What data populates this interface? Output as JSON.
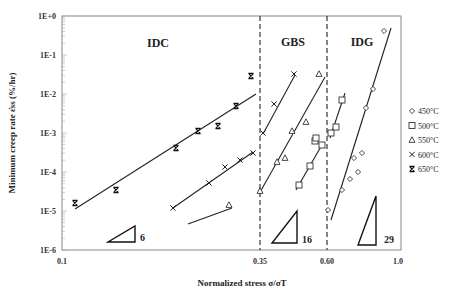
{
  "chart_data": {
    "type": "scatter",
    "title": "",
    "xlabel": "Normalized stress σ/σT",
    "ylabel": "Minimum creep rate ε̇ss (%/hr)",
    "xscale": "log",
    "yscale": "log",
    "xlim": [
      0.1,
      1.0
    ],
    "ylim": [
      1e-06,
      1.0
    ],
    "grid": false,
    "legend_position": "right",
    "x_ticks": [
      "0.1",
      "0.35",
      "0.60",
      "1.0"
    ],
    "y_ticks": [
      "1E+0",
      "1E-1",
      "1E-2",
      "1E-3",
      "1E-4",
      "1E-5",
      "1E-6"
    ],
    "regions": [
      {
        "label": "IDC",
        "x_range": [
          0.1,
          0.35
        ]
      },
      {
        "label": "GBS",
        "x_range": [
          0.35,
          0.6
        ]
      },
      {
        "label": "IDG",
        "x_range": [
          0.6,
          1.0
        ]
      }
    ],
    "boundaries": [
      0.35,
      0.6
    ],
    "slope_indicators": [
      {
        "label": "6",
        "region": "IDC"
      },
      {
        "label": "16",
        "region": "GBS"
      },
      {
        "label": "29",
        "region": "IDG"
      }
    ],
    "series": [
      {
        "name": "450°C",
        "marker": "diamond",
        "points": [
          [
            0.61,
            1.1e-05
          ],
          [
            0.66,
            3.5e-05
          ],
          [
            0.69,
            7e-05
          ],
          [
            0.7,
            0.00025
          ],
          [
            0.72,
            0.0001
          ],
          [
            0.73,
            0.0003
          ],
          [
            0.76,
            0.004
          ],
          [
            0.8,
            0.015
          ],
          [
            0.87,
            0.4
          ]
        ]
      },
      {
        "name": "500°C",
        "marker": "square",
        "points": [
          [
            0.5,
            5e-05
          ],
          [
            0.53,
            0.00016
          ],
          [
            0.55,
            0.0007
          ],
          [
            0.56,
            0.0005
          ],
          [
            0.58,
            0.0006
          ],
          [
            0.62,
            0.0011
          ],
          [
            0.64,
            0.0015
          ],
          [
            0.66,
            0.007
          ]
        ]
      },
      {
        "name": "550°C",
        "marker": "triangle",
        "points": [
          [
            0.31,
            1.5e-05
          ],
          [
            0.35,
            3.5e-05
          ],
          [
            0.4,
            0.00018
          ],
          [
            0.42,
            0.00022
          ],
          [
            0.45,
            0.0011
          ],
          [
            0.48,
            0.0019
          ],
          [
            0.53,
            0.035
          ]
        ]
      },
      {
        "name": "600°C",
        "marker": "x",
        "points": [
          [
            0.2,
            1.2e-05
          ],
          [
            0.24,
            5e-05
          ],
          [
            0.27,
            0.00012
          ],
          [
            0.3,
            0.0002
          ],
          [
            0.33,
            0.0003
          ],
          [
            0.36,
            0.001
          ],
          [
            0.38,
            0.0055
          ],
          [
            0.43,
            0.035
          ]
        ]
      },
      {
        "name": "650°C",
        "marker": "hourglass",
        "points": [
          [
            0.11,
            1.6e-05
          ],
          [
            0.15,
            3.5e-05
          ],
          [
            0.2,
            0.0004
          ],
          [
            0.23,
            0.0012
          ],
          [
            0.26,
            0.0015
          ],
          [
            0.29,
            0.005
          ],
          [
            0.32,
            0.03
          ]
        ]
      }
    ]
  },
  "legend": {
    "items": [
      {
        "label": "450°C",
        "symbol": "◇"
      },
      {
        "label": "500°C",
        "symbol": "□"
      },
      {
        "label": "550°C",
        "symbol": "Δ"
      },
      {
        "label": "600°C",
        "symbol": "×"
      },
      {
        "label": "650°C",
        "symbol": "ⵝ"
      }
    ]
  },
  "labels": {
    "y_axis_title": "Minimum creep rate ε̇ss (%/hr)",
    "x_axis_title": "Normalized stress σ/σT",
    "region_idc": "IDC",
    "region_gbs": "GBS",
    "region_idg": "IDG",
    "slope_6": "6",
    "slope_16": "16",
    "slope_29": "29",
    "xtick_01": "0.1",
    "xtick_035": "0.35",
    "xtick_060": "0.60",
    "xtick_10": "1.0",
    "ytick_0": "1E+0",
    "ytick_1": "1E-1",
    "ytick_2": "1E-2",
    "ytick_3": "1E-3",
    "ytick_4": "1E-4",
    "ytick_5": "1E-5",
    "ytick_6": "1E-6"
  },
  "pixel_layout": {
    "points": {
      "450°C": [
        [
          328,
          210
        ],
        [
          342,
          190
        ],
        [
          350,
          179
        ],
        [
          354,
          158
        ],
        [
          358,
          172
        ],
        [
          362,
          153
        ],
        [
          366,
          108
        ],
        [
          373,
          89
        ],
        [
          384,
          31
        ]
      ],
      "500°C": [
        [
          299,
          185
        ],
        [
          310,
          166
        ],
        [
          315,
          141
        ],
        [
          316,
          138
        ],
        [
          322,
          145
        ],
        [
          331,
          133
        ],
        [
          336,
          127
        ],
        [
          342,
          100
        ]
      ],
      "550°C": [
        [
          229,
          205
        ],
        [
          260,
          191
        ],
        [
          277,
          162
        ],
        [
          285,
          158
        ],
        [
          292,
          131
        ],
        [
          306,
          122
        ],
        [
          319,
          74
        ]
      ],
      "600°C": [
        [
          173,
          208
        ],
        [
          209,
          183
        ],
        [
          225,
          167
        ],
        [
          240,
          160
        ],
        [
          253,
          153
        ],
        [
          263,
          133
        ],
        [
          274,
          104
        ],
        [
          294,
          74
        ]
      ],
      "650°C": [
        [
          75,
          203
        ],
        [
          116,
          190
        ],
        [
          176,
          148
        ],
        [
          198,
          131
        ],
        [
          218,
          126
        ],
        [
          236,
          106
        ],
        [
          251,
          76
        ]
      ]
    },
    "fit_lines": [
      [
        75,
        209,
        256,
        94
      ],
      [
        173,
        208,
        253,
        152
      ],
      [
        188,
        224,
        232,
        208
      ],
      [
        263,
        134,
        295,
        75
      ],
      [
        259,
        194,
        325,
        77
      ],
      [
        296,
        190,
        323,
        143
      ],
      [
        330,
        138,
        345,
        93
      ],
      [
        331,
        220,
        391,
        28
      ]
    ]
  }
}
